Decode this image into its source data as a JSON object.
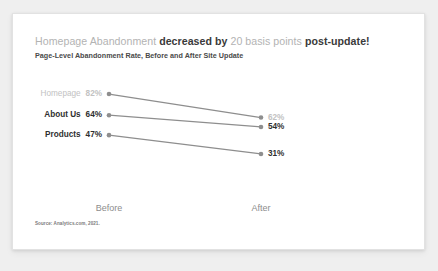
{
  "headline": {
    "segments": [
      {
        "text": "Homepage Abandonment ",
        "style": "mute"
      },
      {
        "text": "decreased by ",
        "style": "bold"
      },
      {
        "text": "20 basis points ",
        "style": "mute"
      },
      {
        "text": "post-update!",
        "style": "bold"
      }
    ]
  },
  "subtitle": "Page-Level Abandonment Rate, Before and After Site Update",
  "source": "Source: Analytics.com, 2021.",
  "colors": {
    "highlight": "#c2c2c2",
    "normal": "#2f2f2f",
    "line": "#8e8e8e",
    "marker": "#8e8e8e",
    "card": "#ffffff",
    "background": "#efefef"
  },
  "chart_data": {
    "type": "line",
    "subtype": "slopegraph",
    "title": "Homepage Abandonment decreased by 20 basis points post-update!",
    "subtitle": "Page-Level Abandonment Rate, Before and After Site Update",
    "xlabel": "",
    "ylabel": "",
    "categories": [
      "Before",
      "After"
    ],
    "x": [
      0,
      1
    ],
    "ylim": [
      25,
      88
    ],
    "grid": false,
    "legend": false,
    "value_suffix": "%",
    "series": [
      {
        "name": "Homepage",
        "values": [
          82,
          62
        ],
        "labels": [
          "82%",
          "62%"
        ],
        "emphasis": "muted"
      },
      {
        "name": "About Us",
        "values": [
          64,
          54
        ],
        "labels": [
          "64%",
          "54%"
        ],
        "emphasis": "normal"
      },
      {
        "name": "Products",
        "values": [
          47,
          31
        ],
        "labels": [
          "47%",
          "31%"
        ],
        "emphasis": "normal"
      }
    ]
  }
}
